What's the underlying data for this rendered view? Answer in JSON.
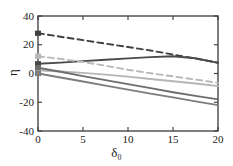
{
  "chart_data": {
    "type": "line",
    "title": "",
    "xlabel": "δ₀",
    "ylabel": "η",
    "xlim": [
      0,
      20
    ],
    "ylim": [
      -40,
      40
    ],
    "xticks": [
      0,
      5,
      10,
      15,
      20
    ],
    "yticks": [
      -40,
      -20,
      0,
      20,
      40
    ],
    "xtick_labels": [
      "0",
      "5",
      "10",
      "15",
      "20"
    ],
    "ytick_labels": [
      "-40",
      "-20",
      "0",
      "20",
      "40"
    ],
    "grid": false,
    "legend": "none",
    "x": [
      0,
      2.5,
      5,
      7.5,
      10,
      12.5,
      15,
      17.5,
      20
    ],
    "series": [
      {
        "name": "dark-dashed-upper",
        "style": "dashed",
        "color": "#404040",
        "marker_at_origin": true,
        "values": [
          28,
          25.6,
          23.2,
          20.8,
          18.4,
          16.0,
          13.2,
          10.4,
          7.5
        ]
      },
      {
        "name": "dark-solid-rising",
        "style": "solid",
        "color": "#4a4a4a",
        "marker_at_origin": true,
        "values": [
          6.8,
          7.6,
          8.6,
          9.6,
          10.5,
          11.4,
          12.0,
          10.6,
          7.4
        ]
      },
      {
        "name": "light-gray-dashed",
        "style": "dashed",
        "color": "#b9b9b9",
        "marker_at_origin": true,
        "values": [
          12.0,
          10.2,
          8.0,
          5.4,
          2.6,
          0.2,
          -2.0,
          -4.2,
          -6.5
        ]
      },
      {
        "name": "light-gray-solid",
        "style": "solid",
        "color": "#b5b5b5",
        "marker_at_origin": true,
        "values": [
          2.2,
          1.4,
          0.4,
          -0.8,
          -2.2,
          -3.8,
          -5.4,
          -7.0,
          -8.8
        ]
      },
      {
        "name": "medium-gray-solid",
        "style": "solid",
        "color": "#6e6e6e",
        "marker_at_origin": true,
        "values": [
          4.0,
          1.2,
          -1.8,
          -4.6,
          -7.4,
          -10.2,
          -13.0,
          -15.6,
          -18.0
        ]
      },
      {
        "name": "dark-gray-solid-lower",
        "style": "solid",
        "color": "#7d7d7d",
        "marker_at_origin": true,
        "values": [
          0.0,
          -2.8,
          -5.6,
          -8.4,
          -11.2,
          -14.0,
          -16.6,
          -19.4,
          -22.0
        ]
      }
    ]
  },
  "axes": {
    "frame_color": "#3a3a3a",
    "background": "#ffffff"
  }
}
